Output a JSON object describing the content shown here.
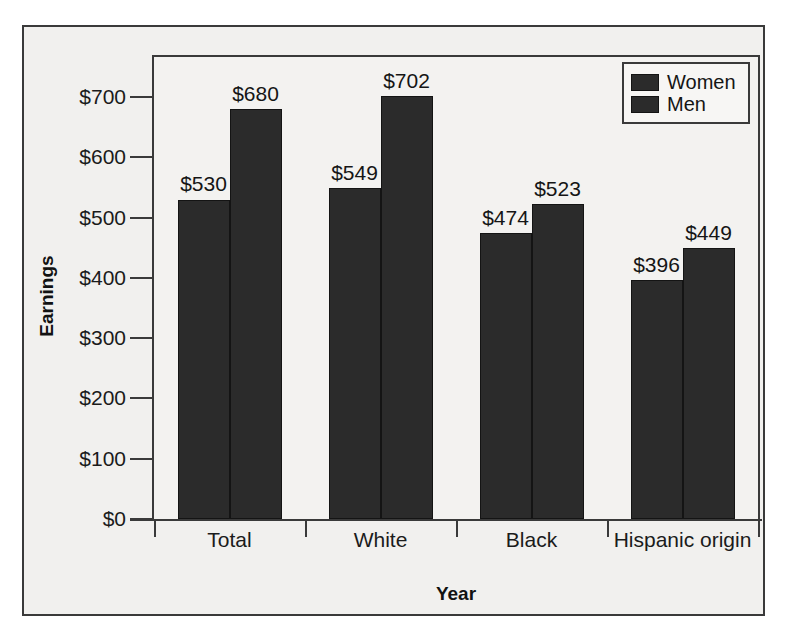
{
  "chart_data": {
    "type": "bar",
    "title": "",
    "xlabel": "Year",
    "ylabel": "Earnings",
    "categories": [
      "Total",
      "White",
      "Black",
      "Hispanic origin"
    ],
    "series": [
      {
        "name": "Women",
        "values": [
          530,
          549,
          474,
          396
        ],
        "color": "#2b2b2b"
      },
      {
        "name": "Men",
        "values": [
          680,
          702,
          523,
          449
        ],
        "color": "#2b2b2b"
      }
    ],
    "value_labels": [
      "$530",
      "$680",
      "$549",
      "$702",
      "$474",
      "$523",
      "$396",
      "$449"
    ],
    "ylim": [
      0,
      700
    ],
    "yticks": [
      0,
      100,
      200,
      300,
      400,
      500,
      600,
      700
    ],
    "ytick_labels": [
      "$0",
      "$100",
      "$200",
      "$300",
      "$400",
      "$500",
      "$600",
      "$700"
    ],
    "grid": false,
    "legend_position": "top-right",
    "value_prefix": "$"
  },
  "legend": {
    "entries": [
      {
        "label": "Women"
      },
      {
        "label": "Men"
      }
    ]
  },
  "axes": {
    "y_title": "Earnings",
    "x_title": "Year"
  },
  "colors": {
    "bar_fill": "#2b2b2b",
    "bar_stroke": "#141414",
    "frame": "#3a3a3a",
    "page_background": "#f1f0ee",
    "plot_background": "#f3f2f0",
    "text": "#151515"
  }
}
